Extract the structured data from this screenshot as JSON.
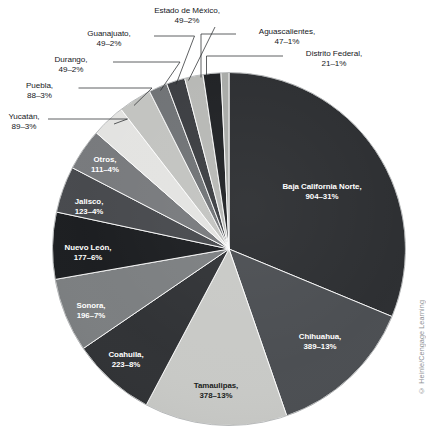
{
  "figure": {
    "credit": "© Heinle/Cengage Learning"
  },
  "chart_data": {
    "type": "pie",
    "title": "",
    "subtitle": "",
    "xlabel": "",
    "ylabel": "",
    "legend_position": "callout-labels",
    "grid": false,
    "value_label_format": "{value}–{percent}%",
    "total": 2883,
    "categories": [
      "Baja California Norte",
      "Chihuahua",
      "Tamaulipas",
      "Coahuila",
      "Sonora",
      "Nuevo León",
      "Jalisco",
      "Otros",
      "Yucatán",
      "Puebla",
      "Durango",
      "Guanajuato",
      "Estado de México",
      "Aguascalientes",
      "Distrito Federal"
    ],
    "values": [
      904,
      389,
      378,
      223,
      196,
      177,
      123,
      111,
      89,
      88,
      49,
      49,
      49,
      47,
      21
    ],
    "percents": [
      31,
      13,
      13,
      8,
      7,
      6,
      4,
      4,
      3,
      3,
      2,
      2,
      2,
      1,
      1
    ],
    "colors": [
      "#2b2d30",
      "#4a4d51",
      "#c8c9c6",
      "#2f3134",
      "#7b7e80",
      "#1a1c1f",
      "#46484c",
      "#77797c",
      "#e3e3e1",
      "#c2c3c0",
      "#6f7275",
      "#3a3c40",
      "#b7b8b5",
      "#1e2023",
      "#a8aaa7"
    ],
    "slices": [
      {
        "label": "Baja California Norte",
        "value": 904,
        "percent": 31,
        "value_label": "904–31%",
        "label_line1": "Baja California Norte,",
        "label_line2": "904–31%",
        "color": "#2b2d30",
        "label_style": "inside-light"
      },
      {
        "label": "Chihuahua",
        "value": 389,
        "percent": 13,
        "value_label": "389–13%",
        "label_line1": "Chihuahua,",
        "label_line2": "389–13%",
        "color": "#4a4d51",
        "label_style": "inside-light"
      },
      {
        "label": "Tamaulipas",
        "value": 378,
        "percent": 13,
        "value_label": "378–13%",
        "label_line1": "Tamaulipas,",
        "label_line2": "378–13%",
        "color": "#c8c9c6",
        "label_style": "inside-dark"
      },
      {
        "label": "Coahuila",
        "value": 223,
        "percent": 8,
        "value_label": "223–8%",
        "label_line1": "Coahuila,",
        "label_line2": "223–8%",
        "color": "#2f3134",
        "label_style": "inside-light"
      },
      {
        "label": "Sonora",
        "value": 196,
        "percent": 7,
        "value_label": "196–7%",
        "label_line1": "Sonora,",
        "label_line2": "196–7%",
        "color": "#7b7e80",
        "label_style": "inside-light"
      },
      {
        "label": "Nuevo León",
        "value": 177,
        "percent": 6,
        "value_label": "177–6%",
        "label_line1": "Nuevo León,",
        "label_line2": "177–6%",
        "color": "#1a1c1f",
        "label_style": "inside-light"
      },
      {
        "label": "Jalisco",
        "value": 123,
        "percent": 4,
        "value_label": "123–4%",
        "label_line1": "Jalisco,",
        "label_line2": "123–4%",
        "color": "#46484c",
        "label_style": "inside-light"
      },
      {
        "label": "Otros",
        "value": 111,
        "percent": 4,
        "value_label": "111–4%",
        "label_line1": "Otros,",
        "label_line2": "111–4%",
        "color": "#77797c",
        "label_style": "inside-light"
      },
      {
        "label": "Yucatán",
        "value": 89,
        "percent": 3,
        "value_label": "89–3%",
        "label_line1": "Yucatán,",
        "label_line2": "89–3%",
        "color": "#e3e3e1",
        "label_style": "callout"
      },
      {
        "label": "Puebla",
        "value": 88,
        "percent": 3,
        "value_label": "88–3%",
        "label_line1": "Puebla,",
        "label_line2": "88–3%",
        "color": "#c2c3c0",
        "label_style": "callout"
      },
      {
        "label": "Durango",
        "value": 49,
        "percent": 2,
        "value_label": "49–2%",
        "label_line1": "Durango,",
        "label_line2": "49–2%",
        "color": "#6f7275",
        "label_style": "callout"
      },
      {
        "label": "Guanajuato",
        "value": 49,
        "percent": 2,
        "value_label": "49–2%",
        "label_line1": "Guanajuato,",
        "label_line2": "49–2%",
        "color": "#3a3c40",
        "label_style": "callout"
      },
      {
        "label": "Estado de México",
        "value": 49,
        "percent": 2,
        "value_label": "49–2%",
        "label_line1": "Estado de México,",
        "label_line2": "49–2%",
        "color": "#b7b8b5",
        "label_style": "callout"
      },
      {
        "label": "Aguascalientes",
        "value": 47,
        "percent": 1,
        "value_label": "47–1%",
        "label_line1": "Aguascalientes,",
        "label_line2": "47–1%",
        "color": "#1e2023",
        "label_style": "callout"
      },
      {
        "label": "Distrito Federal",
        "value": 21,
        "percent": 1,
        "value_label": "21–1%",
        "label_line1": "Distrito Federal,",
        "label_line2": "21–1%",
        "color": "#a8aaa7",
        "label_style": "callout"
      }
    ]
  }
}
